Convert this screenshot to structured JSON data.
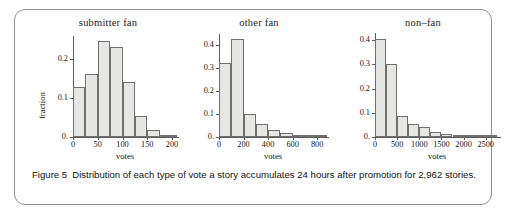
{
  "figure": {
    "caption_label": "Figure 5",
    "caption_text": "Distribution of each type of vote a story accumulates 24 hours after promotion for 2,962 stories.",
    "border_color": "#8e9195",
    "bar_fill": "#e6e6e4",
    "bar_stroke": "#6f6f6f"
  },
  "chart_data": [
    {
      "type": "bar",
      "title": "submitter fan",
      "xlabel": "votes",
      "ylabel": "fraction",
      "xlim": [
        0,
        210
      ],
      "ylim": [
        0,
        0.26
      ],
      "xticks": [
        0,
        50,
        100,
        150,
        200
      ],
      "xtick_labels": [
        "0",
        "50",
        "100",
        "150",
        "200"
      ],
      "yticks": [
        0.0,
        0.1,
        0.2
      ],
      "ytick_labels": [
        "0.",
        "0.1",
        "0.2"
      ],
      "bin_width": 25,
      "bin_starts": [
        0,
        25,
        50,
        75,
        100,
        125,
        150,
        175,
        200
      ],
      "categories": [
        "0-25",
        "25-50",
        "50-75",
        "75-100",
        "100-125",
        "125-150",
        "150-175",
        "175-200",
        "200-210"
      ],
      "values": [
        0.128,
        0.162,
        0.246,
        0.233,
        0.141,
        0.055,
        0.019,
        0.005,
        0.002
      ],
      "grid": false,
      "legend": "none"
    },
    {
      "type": "bar",
      "title": "other  fan",
      "xlabel": "votes",
      "ylabel": "",
      "xlim": [
        0,
        880
      ],
      "ylim": [
        0,
        0.45
      ],
      "xticks": [
        0,
        200,
        400,
        600,
        800
      ],
      "xtick_labels": [
        "0",
        "200",
        "400",
        "600",
        "800"
      ],
      "yticks": [
        0.0,
        0.1,
        0.2,
        0.3,
        0.4
      ],
      "ytick_labels": [
        "0.",
        "0.1",
        "0.2",
        "0.3",
        "0.4"
      ],
      "bin_width": 100,
      "bin_starts": [
        0,
        100,
        200,
        300,
        400,
        500,
        600,
        700,
        800
      ],
      "categories": [
        "0-100",
        "100-200",
        "200-300",
        "300-400",
        "400-500",
        "500-600",
        "600-700",
        "700-800",
        "800-880"
      ],
      "values": [
        0.325,
        0.43,
        0.099,
        0.057,
        0.031,
        0.016,
        0.008,
        0.005,
        0.004
      ],
      "grid": false,
      "legend": "none"
    },
    {
      "type": "bar",
      "title": "non–fan",
      "xlabel": "votes",
      "ylabel": "",
      "xlim": [
        0,
        2800
      ],
      "ylim": [
        0,
        0.43
      ],
      "xticks": [
        0,
        500,
        1000,
        1500,
        2000,
        2500
      ],
      "xtick_labels": [
        "0",
        "500",
        "1000",
        "1500",
        "2000",
        "2500"
      ],
      "yticks": [
        0.0,
        0.1,
        0.2,
        0.3,
        0.4
      ],
      "ytick_labels": [
        "0.",
        "0.1",
        "0.2",
        "0.3",
        "0.4"
      ],
      "bin_width": 250,
      "bin_starts": [
        0,
        250,
        500,
        750,
        1000,
        1250,
        1500,
        1750,
        2000,
        2250,
        2500
      ],
      "categories": [
        "0-250",
        "250-500",
        "500-750",
        "750-1000",
        "1000-1250",
        "1250-1500",
        "1500-1750",
        "1750-2000",
        "2000-2250",
        "2250-2500",
        "2500-2800"
      ],
      "values": [
        0.405,
        0.3,
        0.088,
        0.052,
        0.043,
        0.022,
        0.014,
        0.008,
        0.005,
        0.004,
        0.003
      ],
      "grid": false,
      "legend": "none"
    }
  ]
}
